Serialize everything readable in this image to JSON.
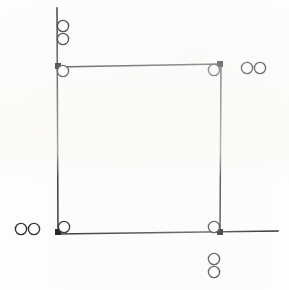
{
  "figure": {
    "background_color": "#fdfdfd",
    "stroke_color": "#2b2b2b",
    "marker_fill": "#ffffff",
    "vertex_fill": "#111111",
    "width": 289,
    "height": 290
  },
  "chart_data": {
    "type": "scatter",
    "title": "",
    "xlabel": "",
    "ylabel": "",
    "xlim": [
      0,
      289
    ],
    "ylim": [
      290,
      0
    ],
    "grid": false,
    "legend": "none",
    "lines": [
      {
        "name": "left-vertical-edge",
        "x1": 57,
        "y1": 8,
        "x2": 58,
        "y2": 233
      },
      {
        "name": "top-horizontal-edge",
        "x1": 57,
        "y1": 67,
        "x2": 221,
        "y2": 64
      },
      {
        "name": "right-vertical-edge",
        "x1": 221,
        "y1": 64,
        "x2": 220,
        "y2": 234
      },
      {
        "name": "bottom-horizontal-edge",
        "x1": 57,
        "y1": 234,
        "x2": 278,
        "y2": 231
      }
    ],
    "vertices": [
      {
        "name": "top-left-vertex",
        "x": 58,
        "y": 66
      },
      {
        "name": "top-right-vertex",
        "x": 220,
        "y": 64
      },
      {
        "name": "bottom-left-vertex",
        "x": 58,
        "y": 232
      },
      {
        "name": "bottom-right-vertex",
        "x": 220,
        "y": 232
      }
    ],
    "markers": [
      {
        "name": "marker-top-left-outer-upper",
        "x": 63,
        "y": 26,
        "r": 5.6,
        "group": "top-left-outer"
      },
      {
        "name": "marker-top-left-outer-lower",
        "x": 63,
        "y": 39,
        "r": 5.6,
        "group": "top-left-outer"
      },
      {
        "name": "marker-top-left-corner",
        "x": 63,
        "y": 71,
        "r": 5.6,
        "group": "corner"
      },
      {
        "name": "marker-top-right-corner",
        "x": 214,
        "y": 70,
        "r": 5.6,
        "group": "corner"
      },
      {
        "name": "marker-top-right-outer-left",
        "x": 247,
        "y": 68,
        "r": 5.6,
        "group": "top-right-outer"
      },
      {
        "name": "marker-top-right-outer-right",
        "x": 260,
        "y": 68,
        "r": 5.6,
        "group": "top-right-outer"
      },
      {
        "name": "marker-bottom-left-outer-left",
        "x": 21,
        "y": 229,
        "r": 5.6,
        "group": "bottom-left-outer"
      },
      {
        "name": "marker-bottom-left-outer-right",
        "x": 34,
        "y": 229,
        "r": 5.6,
        "group": "bottom-left-outer"
      },
      {
        "name": "marker-bottom-left-corner",
        "x": 64,
        "y": 227,
        "r": 5.6,
        "group": "corner"
      },
      {
        "name": "marker-bottom-right-corner",
        "x": 214,
        "y": 227,
        "r": 5.6,
        "group": "corner"
      },
      {
        "name": "marker-bottom-outer-upper",
        "x": 214,
        "y": 259,
        "r": 5.6,
        "group": "bottom-outer"
      },
      {
        "name": "marker-bottom-outer-lower",
        "x": 214,
        "y": 272,
        "r": 5.6,
        "group": "bottom-outer"
      }
    ],
    "counts": {
      "lines": 4,
      "vertices": 4,
      "markers": 12
    }
  }
}
